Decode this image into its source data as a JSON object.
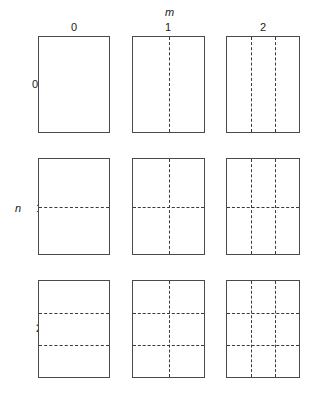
{
  "figure": {
    "title": "",
    "column_variable": "m",
    "row_variable": "n",
    "column_ticks": [
      "0",
      "1",
      "2"
    ],
    "row_ticks": [
      "0",
      "1",
      "2"
    ],
    "line_colors": {
      "solid_border": "#4a4a4a",
      "dashed_divider": "#3a3a3a",
      "background": "#ffffff"
    },
    "cells": [
      {
        "n": "0",
        "m": "0",
        "vertical_dividers": 0,
        "horizontal_dividers": 0
      },
      {
        "n": "0",
        "m": "1",
        "vertical_dividers": 1,
        "horizontal_dividers": 0
      },
      {
        "n": "0",
        "m": "2",
        "vertical_dividers": 2,
        "horizontal_dividers": 0
      },
      {
        "n": "1",
        "m": "0",
        "vertical_dividers": 0,
        "horizontal_dividers": 1
      },
      {
        "n": "1",
        "m": "1",
        "vertical_dividers": 1,
        "horizontal_dividers": 1
      },
      {
        "n": "1",
        "m": "2",
        "vertical_dividers": 2,
        "horizontal_dividers": 1
      },
      {
        "n": "2",
        "m": "0",
        "vertical_dividers": 0,
        "horizontal_dividers": 2
      },
      {
        "n": "2",
        "m": "1",
        "vertical_dividers": 1,
        "horizontal_dividers": 2
      },
      {
        "n": "2",
        "m": "2",
        "vertical_dividers": 2,
        "horizontal_dividers": 2
      }
    ]
  }
}
